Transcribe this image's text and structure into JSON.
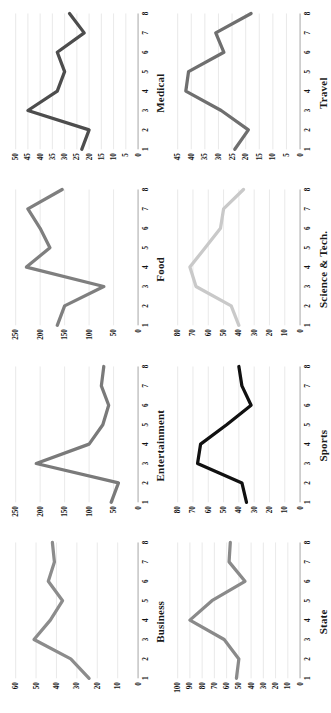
{
  "figure": {
    "title": "",
    "layout": {
      "rows": 2,
      "cols": 4
    },
    "x_categories": [
      "1",
      "2",
      "3",
      "4",
      "5",
      "6",
      "7",
      "8"
    ],
    "grid": "horizontal-only",
    "legend": "none",
    "orientation_note": "rotated"
  },
  "chart_data": [
    {
      "type": "line",
      "title": "Business",
      "xlabel": "",
      "ylabel": "",
      "categories": [
        "1",
        "2",
        "3",
        "4",
        "5",
        "6",
        "7",
        "8"
      ],
      "values": [
        24,
        33,
        51,
        43,
        37,
        44,
        41,
        42
      ],
      "ylim": [
        0,
        60
      ],
      "yticks": [
        0,
        10,
        20,
        30,
        40,
        50,
        60
      ],
      "color": "#8c8c8c",
      "grid": true
    },
    {
      "type": "line",
      "title": "Entertainment",
      "xlabel": "",
      "ylabel": "",
      "categories": [
        "1",
        "2",
        "3",
        "4",
        "5",
        "6",
        "7",
        "8"
      ],
      "values": [
        55,
        40,
        208,
        100,
        72,
        60,
        75,
        70
      ],
      "ylim": [
        0,
        250
      ],
      "yticks": [
        0,
        50,
        100,
        150,
        200,
        250
      ],
      "color": "#7a7a7a",
      "grid": true
    },
    {
      "type": "line",
      "title": "Food",
      "xlabel": "",
      "ylabel": "",
      "categories": [
        "1",
        "2",
        "3",
        "4",
        "5",
        "6",
        "7",
        "8"
      ],
      "values": [
        165,
        150,
        70,
        228,
        180,
        200,
        225,
        155
      ],
      "ylim": [
        0,
        250
      ],
      "yticks": [
        0,
        50,
        100,
        150,
        200,
        250
      ],
      "color": "#7f7f7f",
      "grid": true
    },
    {
      "type": "line",
      "title": "Medical",
      "xlabel": "",
      "ylabel": "",
      "categories": [
        "1",
        "2",
        "3",
        "4",
        "5",
        "6",
        "7",
        "8"
      ],
      "values": [
        23,
        20,
        45,
        33,
        30,
        33,
        22,
        28
      ],
      "ylim": [
        0,
        50
      ],
      "yticks": [
        0,
        5,
        10,
        15,
        20,
        25,
        30,
        35,
        40,
        45,
        50
      ],
      "color": "#4d4d4d",
      "grid": true
    },
    {
      "type": "line",
      "title": "State",
      "xlabel": "",
      "ylabel": "",
      "categories": [
        "1",
        "2",
        "3",
        "4",
        "5",
        "6",
        "7",
        "8"
      ],
      "values": [
        52,
        50,
        62,
        90,
        72,
        45,
        58,
        57
      ],
      "ylim": [
        0,
        100
      ],
      "yticks": [
        0,
        10,
        20,
        30,
        40,
        50,
        60,
        70,
        80,
        90,
        100
      ],
      "color": "#8a8a8a",
      "grid": true
    },
    {
      "type": "line",
      "title": "Sports",
      "xlabel": "",
      "ylabel": "",
      "categories": [
        "1",
        "2",
        "3",
        "4",
        "5",
        "6",
        "7",
        "8"
      ],
      "values": [
        35,
        38,
        67,
        65,
        48,
        32,
        38,
        40
      ],
      "ylim": [
        0,
        80
      ],
      "yticks": [
        0,
        10,
        20,
        30,
        40,
        50,
        60,
        70,
        80
      ],
      "color": "#111111",
      "grid": true
    },
    {
      "type": "line",
      "title": "Science & Tech.",
      "xlabel": "",
      "ylabel": "",
      "categories": [
        "1",
        "2",
        "3",
        "4",
        "5",
        "6",
        "7",
        "8"
      ],
      "values": [
        40,
        45,
        68,
        72,
        62,
        52,
        50,
        37
      ],
      "ylim": [
        0,
        80
      ],
      "yticks": [
        0,
        10,
        20,
        30,
        40,
        50,
        60,
        70,
        80
      ],
      "color": "#c9c9c9",
      "grid": true
    },
    {
      "type": "line",
      "title": "Travel",
      "xlabel": "",
      "ylabel": "",
      "categories": [
        "1",
        "2",
        "3",
        "4",
        "5",
        "6",
        "7",
        "8"
      ],
      "values": [
        24,
        19,
        29,
        42,
        41,
        28,
        31,
        18
      ],
      "ylim": [
        0,
        45
      ],
      "yticks": [
        0,
        5,
        10,
        15,
        20,
        25,
        30,
        35,
        40,
        45
      ],
      "color": "#6f6f6f",
      "grid": true
    }
  ]
}
